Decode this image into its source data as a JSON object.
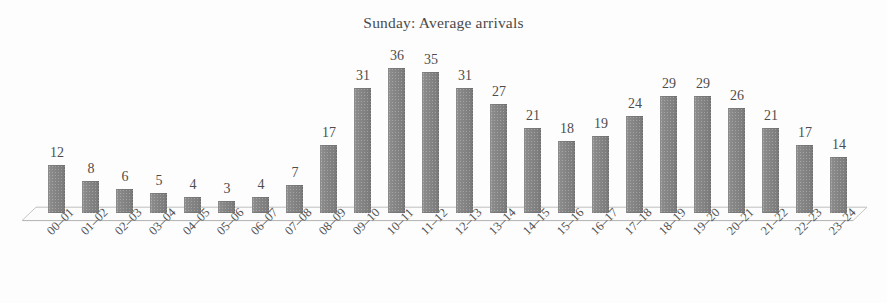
{
  "chart_data": {
    "type": "bar",
    "title": "Sunday: Average arrivals",
    "xlabel": "",
    "ylabel": "",
    "ylim": [
      0,
      36
    ],
    "grid": false,
    "legend": "none",
    "orientation": "vertical",
    "bar_color": "#858585",
    "background_color": "#fdfdfd",
    "text_color": "#4b4b4b",
    "axis_line_color": "#b9b9b9",
    "data_labels_shown": true,
    "x_tick_rotation": -45,
    "categories": [
      "00–01",
      "01–02",
      "02–03",
      "03–04",
      "04–05",
      "05–06",
      "06–07",
      "07–08",
      "08–09",
      "09–10",
      "10–11",
      "11–12",
      "12–13",
      "13–14",
      "14–15",
      "15–16",
      "16–17",
      "17–18",
      "18–19",
      "19–20",
      "20–21",
      "21–22",
      "22–23",
      "23–24"
    ],
    "values": [
      12,
      8,
      6,
      5,
      4,
      3,
      4,
      7,
      17,
      31,
      36,
      35,
      31,
      27,
      21,
      18,
      19,
      24,
      29,
      29,
      26,
      21,
      17,
      14
    ]
  }
}
